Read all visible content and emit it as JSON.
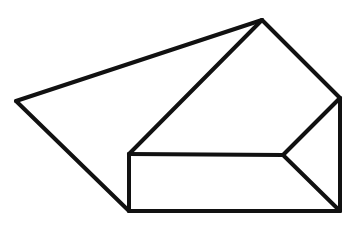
{
  "diagram": {
    "type": "geometric-line-drawing",
    "stroke_color": "#111111",
    "background": "#ffffff",
    "stroke_width": 4,
    "vertices": {
      "A": [
        16,
        101
      ],
      "B": [
        262,
        20
      ],
      "C": [
        340,
        98
      ],
      "D": [
        129,
        154
      ],
      "E": [
        283,
        155
      ],
      "F": [
        129,
        211
      ],
      "G": [
        340,
        211
      ]
    },
    "edges": [
      [
        "A",
        "B"
      ],
      [
        "A",
        "F"
      ],
      [
        "B",
        "D"
      ],
      [
        "B",
        "C"
      ],
      [
        "C",
        "E"
      ],
      [
        "C",
        "G"
      ],
      [
        "D",
        "E"
      ],
      [
        "D",
        "F"
      ],
      [
        "E",
        "G"
      ],
      [
        "F",
        "G"
      ]
    ]
  }
}
